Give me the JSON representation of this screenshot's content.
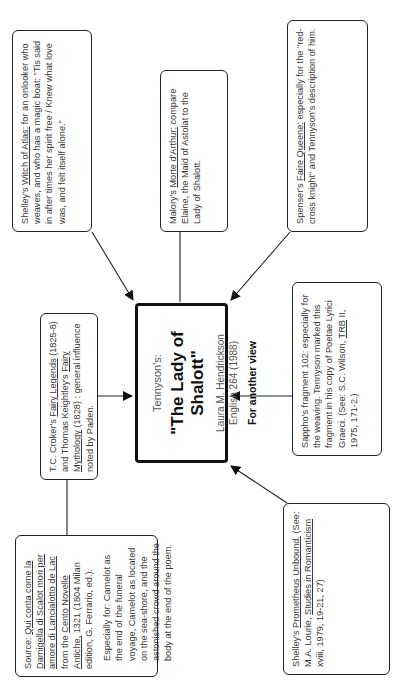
{
  "center": {
    "subtitle": "Tennyson's:",
    "title": "\"The Lady of Shalott\"",
    "author": "Laura M. Hendrickson",
    "course": "English 264 (1988)",
    "link": "For another view"
  },
  "sources": {
    "witch_of_atlas": {
      "prefix": "Shelley's ",
      "work": "Witch of Atlas:",
      "text": " for an onlooker who weaves, and who has a magic boat: \"Tis said in after times her spirit free / Knew what love was, and felt itself alone.\""
    },
    "malory": {
      "prefix": "Malory's ",
      "work": "Morte d'Arthur:",
      "text": " compare Elaine, the Maid of Astolat to the Lady of Shalott."
    },
    "spenser": {
      "prefix": "Spenser's ",
      "work": "Faire Queene:",
      "text": " especially for the \"red-cross knight\" and Tennyson's description of him."
    },
    "croker": {
      "prefix": "T.C. Croker's ",
      "work1": "Fairy Legends",
      "mid": " (1825-8) and Thomas Keightley's ",
      "work2": "Fairy Mythology",
      "text": " (1828) : general influence noted by Paden."
    },
    "sappho": {
      "text1": "Sappho's fragment 102: especially for the weaving. Tennyson marked this fragment in his copy of Poetae Lyrici Graeci. (See: S.C. Wilson, ",
      "work": "TRB",
      "text2": " II, 1975, 171-2.)"
    },
    "qui_conta": {
      "prefix": "Source: ",
      "work1": "Qui conta come la Damigella di Scalot mori per amore di Lancialotto de Lac",
      "mid": " from the ",
      "work2": "Cento Novelle Antiche,",
      "text": " 1321 (1804 Milan edition, G. Ferrario, ed.).",
      "note": "Especially for: Camelot as the end of the funeral voyage, Camelot as located on the sea-shore, and the astonished crowd around the body at the end of the poem."
    },
    "prometheus": {
      "prefix": "Shelley's ",
      "work1": "Prometheus Unbound.",
      "mid": " (See: M.A. Lourie, ",
      "work2": "Studies in Romanticism",
      "text": " xviii, 1979, 19-21, 27)"
    }
  }
}
